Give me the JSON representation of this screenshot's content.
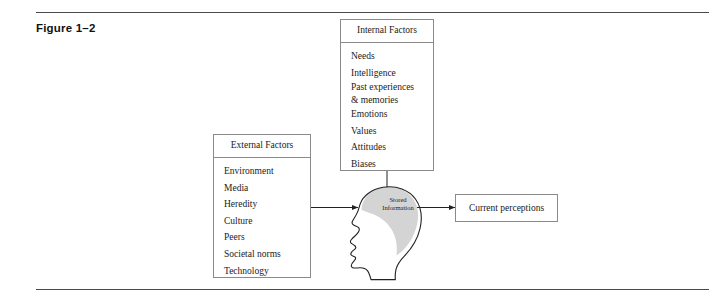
{
  "figure": {
    "label": "Figure 1–2"
  },
  "internal_factors": {
    "title": "Internal Factors",
    "items": [
      "Needs",
      "Intelligence",
      "Past experiences",
      "& memories",
      "Emotions",
      "Values",
      "Attitudes",
      "Biases"
    ]
  },
  "external_factors": {
    "title": "External Factors",
    "items": [
      "Environment",
      "Media",
      "Heredity",
      "Culture",
      "Peers",
      "Societal norms",
      "Technology"
    ]
  },
  "head": {
    "stored_label_line1": "Stored",
    "stored_label_line2": "Information",
    "brain_fill": "#d4d4d4",
    "outline": "#222222"
  },
  "output": {
    "label": "Current perceptions"
  },
  "colors": {
    "rule": "#4a4a4a",
    "box_border": "#8a8a8a",
    "text": "#1a1a1a",
    "background": "#ffffff"
  }
}
